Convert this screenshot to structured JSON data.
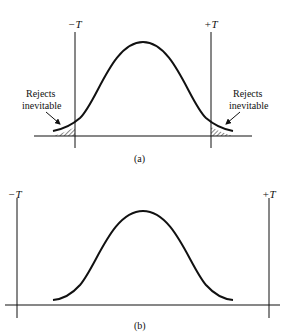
{
  "figure": {
    "panel_a": {
      "caption": "(a)",
      "left_limit_label": "−T",
      "right_limit_label": "+T",
      "left_annotation_line1": "Rejects",
      "left_annotation_line2": "inevitable",
      "right_annotation_line1": "Rejects",
      "right_annotation_line2": "inevitable"
    },
    "panel_b": {
      "caption": "(b)",
      "left_limit_label": "−T",
      "right_limit_label": "+T"
    },
    "colors": {
      "ink": "#111111",
      "background": "#ffffff"
    }
  }
}
